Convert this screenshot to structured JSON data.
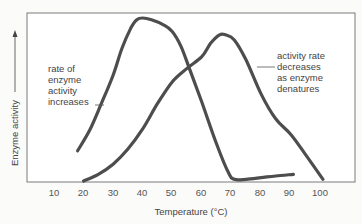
{
  "chart_data": {
    "type": "line",
    "title": "",
    "xlabel": "Temperature (°C)",
    "ylabel": "Enzyme activity",
    "xlim": [
      10,
      100
    ],
    "ylim": [
      0,
      100
    ],
    "xticks": [
      10,
      20,
      30,
      40,
      50,
      60,
      70,
      80,
      90,
      100
    ],
    "yticks": [],
    "grid": false,
    "legend": null,
    "series": [
      {
        "name": "Enzyme A (optimum ~40°C)",
        "x": [
          18,
          22,
          26,
          30,
          33,
          36,
          38,
          40,
          43,
          47,
          50,
          53,
          56,
          60,
          65,
          69,
          71,
          75,
          80,
          85,
          91
        ],
        "y": [
          18,
          30,
          46,
          63,
          79,
          91,
          96,
          97,
          96,
          93,
          89,
          80,
          66,
          47,
          22,
          5,
          1,
          1,
          2,
          3,
          4
        ]
      },
      {
        "name": "Enzyme B (optimum ~67°C)",
        "x": [
          20,
          25,
          30,
          35,
          40,
          45,
          50,
          55,
          60,
          63,
          66,
          68,
          71,
          75,
          80,
          85,
          90,
          95,
          101
        ],
        "y": [
          0,
          4,
          10,
          19,
          31,
          46,
          59,
          67,
          74,
          82,
          87,
          87,
          84,
          72,
          52,
          37,
          28,
          16,
          1
        ]
      }
    ],
    "annotations": [
      {
        "text": "rate of enzyme activity increases",
        "points_to": "Enzyme A rising edge",
        "x": 33
      },
      {
        "text": "activity rate decreases as enzyme denatures",
        "points_to": "Enzyme B falling edge",
        "x": 75
      }
    ]
  },
  "axes": {
    "x_label": "Temperature (°C)",
    "y_label": "Enzyme activity",
    "x_ticks": [
      "10",
      "20",
      "30",
      "40",
      "50",
      "60",
      "70",
      "80",
      "90",
      "100"
    ]
  },
  "annotations": {
    "left": [
      "rate of",
      "enzyme",
      "activity",
      "increases"
    ],
    "right": [
      "activity rate",
      "decreases",
      "as enzyme",
      "denatures"
    ]
  },
  "colors": {
    "curve": "#4d4d4d",
    "frame": "#7a7a7a",
    "background": "#fbfbfa",
    "text": "#4a4a4a"
  }
}
